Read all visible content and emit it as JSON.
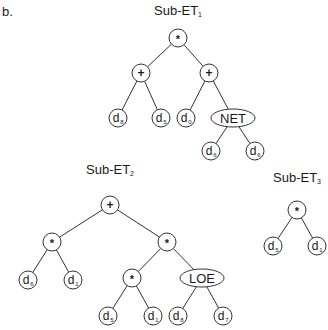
{
  "panel_label": "b.",
  "colors": {
    "stroke": "#333333",
    "fill": "#ffffff",
    "text": "#1a1a1a"
  },
  "trees": [
    {
      "id": "sub-et-1",
      "title": "Sub-ET",
      "title_sub": "1",
      "title_pos": [
        178,
        13
      ],
      "nodes": [
        {
          "id": "a0",
          "label": "*",
          "type": "op",
          "x": 178,
          "y": 38
        },
        {
          "id": "a1",
          "label": "+",
          "type": "op",
          "x": 141,
          "y": 73,
          "parent": "a0"
        },
        {
          "id": "a2",
          "label": "+",
          "type": "op",
          "x": 209,
          "y": 73,
          "parent": "a0"
        },
        {
          "id": "a3",
          "label": "d",
          "sub": "8",
          "type": "leaf",
          "x": 118,
          "y": 118,
          "parent": "a1"
        },
        {
          "id": "a4",
          "label": "d",
          "sub": "5",
          "type": "leaf",
          "x": 161,
          "y": 118,
          "parent": "a1"
        },
        {
          "id": "a5",
          "label": "d",
          "sub": "0",
          "type": "leaf",
          "x": 186,
          "y": 118,
          "parent": "a2"
        },
        {
          "id": "a6",
          "label": "NET",
          "type": "func",
          "x": 233,
          "y": 118,
          "parent": "a2"
        },
        {
          "id": "a7",
          "label": "d",
          "sub": "6",
          "type": "leaf",
          "x": 211,
          "y": 151,
          "parent": "a6"
        },
        {
          "id": "a8",
          "label": "d",
          "sub": "6",
          "type": "leaf",
          "x": 255,
          "y": 151,
          "parent": "a6"
        }
      ]
    },
    {
      "id": "sub-et-2",
      "title": "Sub-ET",
      "title_sub": "2",
      "title_pos": [
        110,
        172
      ],
      "nodes": [
        {
          "id": "b0",
          "label": "+",
          "type": "op",
          "x": 110,
          "y": 205
        },
        {
          "id": "b1",
          "label": "*",
          "type": "op",
          "x": 52,
          "y": 242,
          "parent": "b0"
        },
        {
          "id": "b2",
          "label": "*",
          "type": "op",
          "x": 167,
          "y": 242,
          "parent": "b0"
        },
        {
          "id": "b3",
          "label": "d",
          "sub": "6",
          "type": "leaf",
          "x": 28,
          "y": 280,
          "parent": "b1"
        },
        {
          "id": "b4",
          "label": "d",
          "sub": "1",
          "type": "leaf",
          "x": 73,
          "y": 280,
          "parent": "b1"
        },
        {
          "id": "b5",
          "label": "*",
          "type": "op",
          "x": 132,
          "y": 278,
          "parent": "b2"
        },
        {
          "id": "b6",
          "label": "LOE",
          "type": "func",
          "x": 202,
          "y": 278,
          "parent": "b2"
        },
        {
          "id": "b7",
          "label": "d",
          "sub": "5",
          "type": "leaf",
          "x": 108,
          "y": 316,
          "parent": "b5"
        },
        {
          "id": "b8",
          "label": "d",
          "sub": "1",
          "type": "leaf",
          "x": 153,
          "y": 316,
          "parent": "b5"
        },
        {
          "id": "b9",
          "label": "d",
          "sub": "8",
          "type": "leaf",
          "x": 178,
          "y": 316,
          "parent": "b6"
        },
        {
          "id": "b10",
          "label": "d",
          "sub": "7",
          "type": "leaf",
          "x": 223,
          "y": 316,
          "parent": "b6"
        }
      ]
    },
    {
      "id": "sub-et-3",
      "title": "Sub-ET",
      "title_sub": "3",
      "title_pos": [
        297,
        180
      ],
      "nodes": [
        {
          "id": "c0",
          "label": "*",
          "type": "op",
          "x": 297,
          "y": 210
        },
        {
          "id": "c1",
          "label": "d",
          "sub": "5",
          "type": "leaf",
          "x": 273,
          "y": 246,
          "parent": "c0"
        },
        {
          "id": "c2",
          "label": "d",
          "sub": "1",
          "type": "leaf",
          "x": 317,
          "y": 246,
          "parent": "c0"
        }
      ]
    }
  ]
}
